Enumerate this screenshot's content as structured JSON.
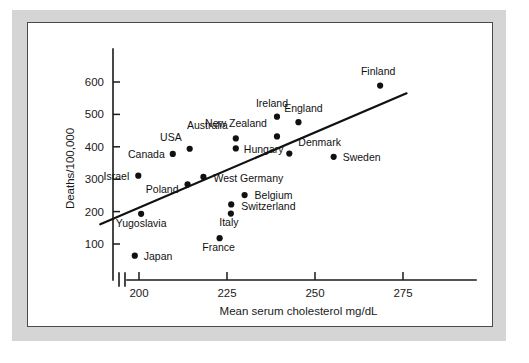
{
  "figure": {
    "background_color": "#d5d5d5",
    "card_color": "#ffffff",
    "border_color": "#4a4a4a",
    "ink_color": "#111111"
  },
  "chart_data": {
    "type": "scatter",
    "title": "",
    "xlabel": "Mean serum cholesterol mg/dL",
    "ylabel": "Deaths/100,000",
    "xlim": [
      183,
      283
    ],
    "ylim": [
      40,
      660
    ],
    "x_ticks": [
      200,
      225,
      250,
      275
    ],
    "x_tick_labels": [
      "200",
      "225",
      "250",
      "275"
    ],
    "y_ticks": [
      100,
      200,
      300,
      400,
      500,
      600
    ],
    "y_tick_labels": [
      "100",
      "200",
      "300",
      "400",
      "500",
      "600"
    ],
    "grid": false,
    "legend": "none",
    "axis_break": true,
    "points": [
      {
        "label": "Finland",
        "x": 268.5,
        "y": 589,
        "label_dx": -2,
        "label_dy": -11,
        "label_anchor": "middle"
      },
      {
        "label": "Ireland",
        "x": 239.2,
        "y": 493,
        "label_dx": -5,
        "label_dy": -10,
        "label_anchor": "middle"
      },
      {
        "label": "England",
        "x": 245.3,
        "y": 476,
        "label_dx": 5,
        "label_dy": -10,
        "label_anchor": "middle"
      },
      {
        "label": "New Zealand",
        "x": 239.2,
        "y": 432,
        "label_dx": -10,
        "label_dy": -9,
        "label_anchor": "end"
      },
      {
        "label": "Australia",
        "x": 227.5,
        "y": 426,
        "label_dx": -8,
        "label_dy": -9,
        "label_anchor": "end"
      },
      {
        "label": "Hungary",
        "x": 227.5,
        "y": 395,
        "label_dx": 8,
        "label_dy": 5,
        "label_anchor": "start"
      },
      {
        "label": "USA",
        "x": 214.4,
        "y": 394,
        "label_dx": -8,
        "label_dy": -8,
        "label_anchor": "end"
      },
      {
        "label": "Canada",
        "x": 209.6,
        "y": 378,
        "label_dx": -8,
        "label_dy": 4,
        "label_anchor": "end"
      },
      {
        "label": "Denmark",
        "x": 242.7,
        "y": 379,
        "label_dx": 9,
        "label_dy": -8,
        "label_anchor": "start"
      },
      {
        "label": "Sweden",
        "x": 255.3,
        "y": 369,
        "label_dx": 9,
        "label_dy": 4,
        "label_anchor": "start"
      },
      {
        "label": "Israel",
        "x": 199.8,
        "y": 311,
        "label_dx": -9,
        "label_dy": 4,
        "label_anchor": "end"
      },
      {
        "label": "West Germany",
        "x": 218.3,
        "y": 307,
        "label_dx": 10,
        "label_dy": 5,
        "label_anchor": "start"
      },
      {
        "label": "Poland",
        "x": 213.8,
        "y": 284,
        "label_dx": -9,
        "label_dy": 9,
        "label_anchor": "end"
      },
      {
        "label": "Belgium",
        "x": 230.0,
        "y": 251,
        "label_dx": 10,
        "label_dy": 4,
        "label_anchor": "start"
      },
      {
        "label": "Switzerland",
        "x": 226.2,
        "y": 222,
        "label_dx": 10,
        "label_dy": 6,
        "label_anchor": "start"
      },
      {
        "label": "Italy",
        "x": 226.1,
        "y": 194,
        "label_dx": -2,
        "label_dy": 12,
        "label_anchor": "middle"
      },
      {
        "label": "Yugoslavia",
        "x": 200.6,
        "y": 193,
        "label_dx": 0,
        "label_dy": 13,
        "label_anchor": "middle"
      },
      {
        "label": "France",
        "x": 222.9,
        "y": 118,
        "label_dx": -1,
        "label_dy": 13,
        "label_anchor": "middle"
      },
      {
        "label": "Japan",
        "x": 198.8,
        "y": 64,
        "label_dx": 9,
        "label_dy": 4,
        "label_anchor": "start"
      }
    ],
    "trend_line": {
      "x_start": 189.0,
      "y_start": 161,
      "x_end": 276.0,
      "y_end": 565
    }
  }
}
